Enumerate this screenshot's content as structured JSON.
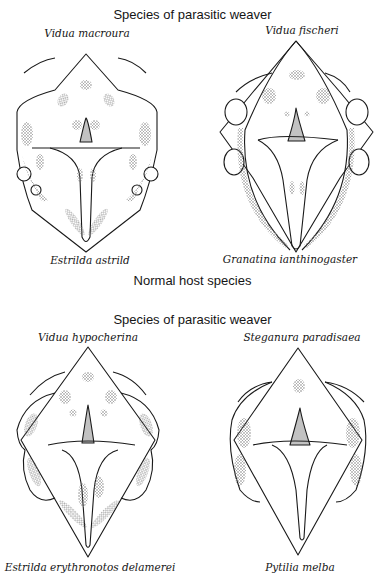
{
  "header": {
    "top_title": "Species of parasitic weaver",
    "middle_title": "Normal host species",
    "second_title": "Species of parasitic weaver"
  },
  "panels": [
    {
      "parasite": "Vidua macroura",
      "host": "Estrilda astrild"
    },
    {
      "parasite": "Vidua fischeri",
      "host": "Granatina ianthinogaster"
    },
    {
      "parasite": "Vidua hypocherina",
      "host": "Estrilda erythronotos delamerei"
    },
    {
      "parasite": "Steganura paradisaea",
      "host": "Pytilia melba"
    }
  ],
  "figure": {
    "line_color": "#1a1a1a",
    "stipple_color": "#777777"
  }
}
